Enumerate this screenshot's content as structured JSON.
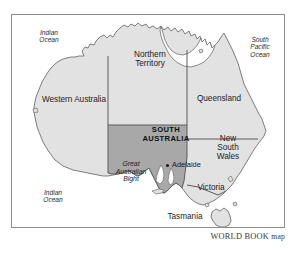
{
  "figure": {
    "type": "map",
    "credit_caps": "WORLD BOOK",
    "credit_lower": "map",
    "colors": {
      "land_fill": "#e2e2e2",
      "highlight_fill": "#a8a8a8",
      "coastline": "#6f6f6f",
      "border_line": "#5c5c5c",
      "frame": "#8c8c8c",
      "page_background": "#ffffff",
      "text": "#1a1a1a"
    }
  },
  "labels": {
    "states": [
      {
        "name": "northern-territory",
        "lines": [
          "Northern",
          "Territory"
        ],
        "x": 121,
        "y": 50,
        "w": 58
      },
      {
        "name": "western-australia",
        "lines": [
          "Western Australia"
        ],
        "x": 22,
        "y": 95,
        "w": 104
      },
      {
        "name": "queensland",
        "lines": [
          "Queensland"
        ],
        "x": 186,
        "y": 94,
        "w": 66
      },
      {
        "name": "new-south-wales",
        "lines": [
          "New",
          "South",
          "Wales"
        ],
        "x": 206,
        "y": 134,
        "w": 44
      },
      {
        "name": "victoria",
        "lines": [
          "Victoria"
        ],
        "x": 188,
        "y": 183,
        "w": 46
      },
      {
        "name": "tasmania",
        "lines": [
          "Tasmania"
        ],
        "x": 160,
        "y": 212,
        "w": 50
      }
    ],
    "highlighted_state": {
      "name": "south-australia",
      "lines": [
        "SOUTH",
        "AUSTRALIA"
      ],
      "x": 130,
      "y": 126,
      "w": 72
    },
    "oceans": [
      {
        "name": "indian-ocean-north",
        "lines": [
          "Indian",
          "Ocean"
        ],
        "x": 28,
        "y": 29,
        "w": 42
      },
      {
        "name": "south-pacific-ocean",
        "lines": [
          "South",
          "Pacific",
          "Ocean"
        ],
        "x": 238,
        "y": 36,
        "w": 44
      },
      {
        "name": "indian-ocean-south",
        "lines": [
          "Indian",
          "Ocean"
        ],
        "x": 32,
        "y": 189,
        "w": 42
      }
    ],
    "water_features": [
      {
        "name": "great-australian-bight",
        "lines": [
          "Great",
          "Australian",
          "Bight"
        ],
        "x": 104,
        "y": 160,
        "w": 54
      }
    ],
    "cities": [
      {
        "name": "adelaide",
        "label": "Adelaide",
        "x": 172,
        "y": 161,
        "dot_x": 166,
        "dot_y": 164
      }
    ]
  }
}
